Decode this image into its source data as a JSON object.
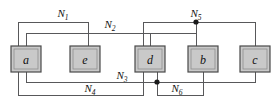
{
  "diagram": {
    "type": "netlist-connectivity-diagram",
    "width": 278,
    "height": 108,
    "background_color": "#ffffff",
    "wire_color": "#58585a",
    "node_fill_color": "#c9c9c9",
    "node_border_color": "#4a4a4a",
    "label_color": "#111111",
    "nodes": [
      {
        "id": "a",
        "label": "a",
        "x": 11,
        "y": 46,
        "width": 30,
        "height": 26,
        "cx": 26,
        "cy": 59
      },
      {
        "id": "e",
        "label": "e",
        "x": 70,
        "y": 46,
        "width": 30,
        "height": 26,
        "cx": 85,
        "cy": 59
      },
      {
        "id": "d",
        "label": "d",
        "x": 135,
        "y": 46,
        "width": 30,
        "height": 26,
        "cx": 150,
        "cy": 59
      },
      {
        "id": "b",
        "label": "b",
        "x": 188,
        "y": 46,
        "width": 30,
        "height": 26,
        "cx": 203,
        "cy": 59
      },
      {
        "id": "c",
        "label": "c",
        "x": 240,
        "y": 46,
        "width": 30,
        "height": 26,
        "cx": 255,
        "cy": 59
      }
    ],
    "nets": [
      {
        "id": "N1",
        "base": "N",
        "subscript": "1",
        "label_x": 63,
        "label_y": 17,
        "connects": [
          "a",
          "e"
        ],
        "path": "M 18,72 L 18,22 L 88,22 L 88,46"
      },
      {
        "id": "N2",
        "base": "N",
        "subscript": "2",
        "label_x": 110,
        "label_y": 28,
        "connects": [
          "a",
          "d",
          "b"
        ],
        "path": "M 26,46 L 26,33 L 196,33 L 196,46 M 150,33 L 150,46"
      },
      {
        "id": "N3",
        "base": "N",
        "subscript": "3",
        "label_x": 122,
        "label_y": 79,
        "connects": [
          "a",
          "d",
          "c"
        ],
        "path": "M 26,72 L 26,82 L 255,82 L 255,72"
      },
      {
        "id": "N4",
        "base": "N",
        "subscript": "4",
        "label_x": 90,
        "label_y": 92,
        "connects": [
          "a",
          "d"
        ],
        "path": "M 18,72 L 18,95 L 143,95 L 143,72"
      },
      {
        "id": "N5",
        "base": "N",
        "subscript": "5",
        "label_x": 196,
        "label_y": 17,
        "connects": [
          "d",
          "b",
          "c"
        ],
        "path": "M 143,46 L 143,22 L 255,22 L 255,46 M 196,22 L 196,46"
      },
      {
        "id": "N6",
        "base": "N",
        "subscript": "6",
        "label_x": 177,
        "label_y": 92,
        "connects": [
          "d",
          "b"
        ],
        "path": "M 157,72 L 157,95 L 203,95 L 203,72"
      }
    ],
    "junctions": [
      {
        "id": "junction-n5-b",
        "x": 196,
        "y": 22,
        "r": 2.6,
        "net": "N5"
      },
      {
        "id": "junction-n3-d",
        "x": 157,
        "y": 82,
        "r": 2.6,
        "net": "N3"
      }
    ]
  }
}
